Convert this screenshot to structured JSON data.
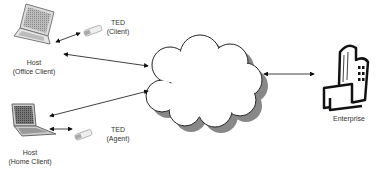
{
  "nodes": {
    "office_host": {
      "line1": "Host",
      "line2": "(Office Client)"
    },
    "office_ted": {
      "line1": "TED",
      "line2": "(Client)"
    },
    "home_host": {
      "line1": "Host",
      "line2": "(Home Client)"
    },
    "home_ted": {
      "line1": "TED",
      "line2": "(Agent)"
    },
    "cloud": {
      "label": ""
    },
    "enterprise": {
      "label": "Enterprise"
    }
  },
  "connections": [
    {
      "from": "office_host",
      "to": "office_ted",
      "type": "bidirectional"
    },
    {
      "from": "office_host",
      "to": "cloud",
      "type": "bidirectional"
    },
    {
      "from": "home_host",
      "to": "cloud",
      "type": "bidirectional"
    },
    {
      "from": "home_host",
      "to": "home_ted",
      "type": "bidirectional"
    },
    {
      "from": "cloud",
      "to": "enterprise",
      "type": "bidirectional"
    }
  ]
}
